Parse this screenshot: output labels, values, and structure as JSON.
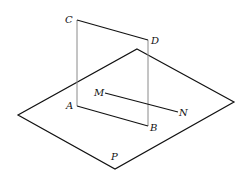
{
  "diagram": {
    "plane_label": "P",
    "points": {
      "A": "A",
      "B": "B",
      "C": "C",
      "D": "D",
      "M": "M",
      "N": "N"
    },
    "colors": {
      "stroke": "#111111",
      "vertical_edges": "#8a8a8a",
      "background": "#ffffff"
    }
  }
}
